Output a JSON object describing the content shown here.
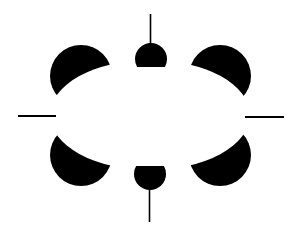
{
  "figure": {
    "title": "",
    "colors": {
      "background": "#ffffff",
      "ink": "#000000"
    },
    "elements": [
      "top-left-notched-disk",
      "top-right-notched-disk",
      "bottom-left-notched-disk",
      "bottom-right-notched-disk",
      "top-truncated-disk",
      "bottom-truncated-disk",
      "top-vertical-line",
      "bottom-vertical-line",
      "left-horizontal-line",
      "right-horizontal-line"
    ]
  }
}
